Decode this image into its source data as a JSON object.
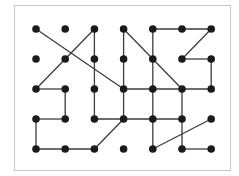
{
  "diagram": {
    "type": "dot-grid-graph",
    "grid": {
      "columns": 7,
      "rows": 5
    },
    "colors": {
      "dot": "#1a1a1a",
      "edge": "#3c3c3c",
      "frame": "#c8c8c8",
      "background": "#ffffff"
    },
    "edges": [
      [
        [
          0,
          0
        ],
        [
          3,
          2
        ]
      ],
      [
        [
          0,
          2
        ],
        [
          2,
          0
        ]
      ],
      [
        [
          2,
          0
        ],
        [
          2,
          3
        ]
      ],
      [
        [
          3,
          0
        ],
        [
          3,
          3
        ]
      ],
      [
        [
          3,
          0
        ],
        [
          5,
          2
        ]
      ],
      [
        [
          4,
          0
        ],
        [
          4,
          4
        ]
      ],
      [
        [
          4,
          0
        ],
        [
          6,
          0
        ]
      ],
      [
        [
          6,
          0
        ],
        [
          5,
          1
        ]
      ],
      [
        [
          5,
          1
        ],
        [
          6,
          1
        ]
      ],
      [
        [
          6,
          1
        ],
        [
          6,
          2
        ]
      ],
      [
        [
          3,
          2
        ],
        [
          6,
          2
        ]
      ],
      [
        [
          5,
          2
        ],
        [
          5,
          4
        ]
      ],
      [
        [
          5,
          4
        ],
        [
          6,
          4
        ]
      ],
      [
        [
          2,
          3
        ],
        [
          5,
          3
        ]
      ],
      [
        [
          4,
          4
        ],
        [
          6,
          3
        ]
      ],
      [
        [
          2,
          4
        ],
        [
          3,
          3
        ]
      ],
      [
        [
          0,
          2
        ],
        [
          1,
          2
        ]
      ],
      [
        [
          1,
          2
        ],
        [
          1,
          3
        ]
      ],
      [
        [
          1,
          3
        ],
        [
          0,
          3
        ]
      ],
      [
        [
          0,
          3
        ],
        [
          0,
          4
        ]
      ],
      [
        [
          0,
          4
        ],
        [
          2,
          4
        ]
      ]
    ]
  }
}
